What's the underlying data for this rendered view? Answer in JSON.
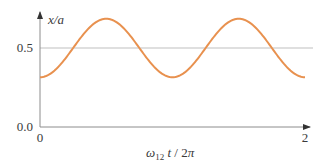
{
  "chart_data": {
    "type": "line",
    "title": "",
    "xlabel": "ω12 t / 2π",
    "xlabel_parts": {
      "omega": "ω",
      "sub": "12",
      "rest_t": " t",
      "slash": " / 2",
      "pi": "π"
    },
    "ylabel": "x/a",
    "xlim": [
      0,
      2
    ],
    "ylim": [
      0,
      0.75
    ],
    "x_ticks": [
      {
        "value": 0,
        "label": "0"
      },
      {
        "value": 2,
        "label": "2"
      }
    ],
    "y_ticks": [
      {
        "value": 0.0,
        "label": "0.0"
      },
      {
        "value": 0.5,
        "label": "0.5"
      }
    ],
    "reference_lines": [
      {
        "axis": "y",
        "value": 0.5,
        "color": "#bfbfbf"
      }
    ],
    "grid": false,
    "legend": null,
    "series": [
      {
        "name": "x/a",
        "color": "#e8914f",
        "function": "0.5 - 0.185*cos(2*pi*x)",
        "mean": 0.5,
        "amplitude": 0.185,
        "period": 1,
        "x": [
          0.0,
          0.1,
          0.2,
          0.3,
          0.4,
          0.5,
          0.6,
          0.7,
          0.8,
          0.9,
          1.0,
          1.1,
          1.2,
          1.3,
          1.4,
          1.5,
          1.6,
          1.7,
          1.8,
          1.9,
          2.0
        ],
        "values": [
          0.315,
          0.35,
          0.443,
          0.557,
          0.65,
          0.685,
          0.65,
          0.557,
          0.443,
          0.35,
          0.315,
          0.35,
          0.443,
          0.557,
          0.65,
          0.685,
          0.65,
          0.557,
          0.443,
          0.35,
          0.315
        ]
      }
    ]
  },
  "colors": {
    "axis": "#8c8c8c",
    "reference": "#bfbfbf",
    "curve": "#e8914f",
    "text": "#3a3a3a"
  }
}
